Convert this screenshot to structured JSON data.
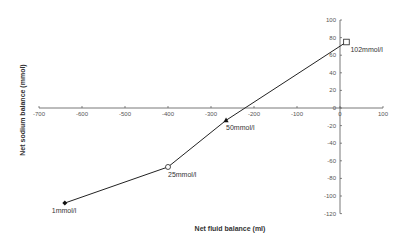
{
  "chart_data": {
    "type": "line",
    "title": "",
    "xlabel": "Net fluid balance (ml)",
    "ylabel": "Net sodium balance (mmol)",
    "xlim": [
      -700,
      100
    ],
    "ylim": [
      -120,
      100
    ],
    "xticks": [
      -700,
      -600,
      -500,
      -400,
      -300,
      -200,
      -100,
      0,
      100
    ],
    "yticks": [
      100,
      80,
      60,
      40,
      20,
      0,
      -20,
      -40,
      -60,
      -80,
      -100,
      -120
    ],
    "grid": false,
    "legend": null,
    "series": [
      {
        "name": "Net sodium vs fluid balance",
        "points": [
          {
            "x": -640,
            "y": -108,
            "label": "1mmol/l",
            "marker": "filled-diamond"
          },
          {
            "x": -400,
            "y": -67,
            "label": "25mmol/l",
            "marker": "open-circle"
          },
          {
            "x": -265,
            "y": -14,
            "label": "50mmol/l",
            "marker": "filled-triangle"
          },
          {
            "x": 15,
            "y": 75,
            "label": "102mmol/l",
            "marker": "open-square"
          }
        ]
      }
    ],
    "colors": {
      "line": "#222222",
      "axis": "#555555",
      "text": "#333333"
    }
  }
}
